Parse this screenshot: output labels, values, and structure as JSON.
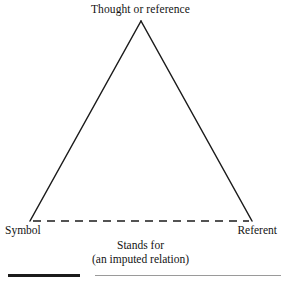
{
  "figure": {
    "type": "semiotic-triangle",
    "background_color": "#ffffff",
    "line_color": "#1b1b1b",
    "apex_label": "Thought or reference",
    "left_vertex_label": "Symbol",
    "right_vertex_label": "Referent",
    "base_relation_caption": {
      "line1": "Stands for",
      "line2": "(an imputed relation)"
    },
    "geometry": {
      "apex": {
        "x": 141,
        "y": 21
      },
      "left_vertex": {
        "x": 30,
        "y": 221
      },
      "right_vertex": {
        "x": 252,
        "y": 221
      },
      "left_side_style": "solid",
      "right_side_style": "solid",
      "base_style": "dashed",
      "stroke_width": 1.5,
      "dash_pattern": "8 6"
    }
  },
  "rules": {
    "thick_rule_color": "#1b1b1b",
    "thin_rule_color": "#9a9a9a"
  }
}
